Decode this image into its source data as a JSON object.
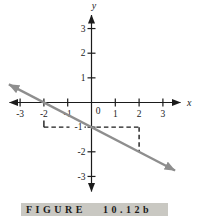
{
  "caption": {
    "label": "FIGURE",
    "number": "10.12b"
  },
  "colors": {
    "background": "#ffffff",
    "axis": "#1b1b1b",
    "tick_text": "#1b1b1b",
    "dash": "#1b1b1b",
    "graph_line": "#8e8e8e",
    "caption_bg": "#c9c8c2",
    "caption_text": "#1b1b1b",
    "label_mask": "#ffffff"
  },
  "chart_data": {
    "type": "line",
    "title": "",
    "xlabel": "x",
    "ylabel": "y",
    "xlim": [
      -3.8,
      4.1
    ],
    "ylim": [
      -3.8,
      3.9
    ],
    "grid": false,
    "legend": false,
    "x_ticks": [
      -3,
      -2,
      -1,
      1,
      2,
      3
    ],
    "x_tick_labels": [
      "-3",
      "-2",
      "-1",
      "1",
      "2",
      "3"
    ],
    "origin_label": "0",
    "y_ticks": [
      3,
      2,
      1,
      -1,
      -2,
      -3
    ],
    "y_tick_labels": [
      "3",
      "2",
      "1",
      "-1",
      "-2",
      "-3"
    ],
    "y_label_special": {
      "value": -1,
      "label": "-1",
      "dx": -1.5,
      "masked": true
    },
    "series": [
      {
        "name": "y = -(1/2)x - 1",
        "slope": -0.5,
        "y_intercept": -1,
        "x_intercept": -2,
        "points_on_line": [
          [
            -2,
            0
          ],
          [
            0,
            -1
          ],
          [
            2,
            -2
          ]
        ],
        "draw_range_x": [
          -3.47,
          3.51
        ],
        "arrows": "both"
      }
    ],
    "dashed_guides": [
      {
        "from": [
          -2,
          -0.73
        ],
        "to": [
          -2,
          -1
        ],
        "style": "solid"
      },
      {
        "from": [
          -2,
          -1
        ],
        "to": [
          2,
          -1
        ],
        "style": "dashed"
      },
      {
        "from": [
          2,
          -1
        ],
        "to": [
          2,
          -2
        ],
        "style": "dashed"
      }
    ]
  }
}
